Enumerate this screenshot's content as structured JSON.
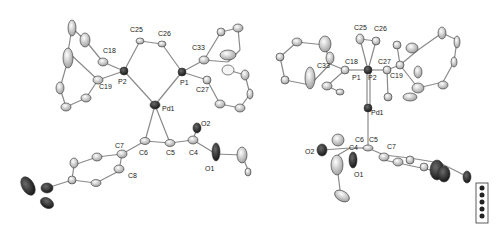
{
  "figure": {
    "type": "ORTEP crystal structure (two views)",
    "background": "#ffffff",
    "colors": {
      "bond": "#8a8a8a",
      "atom_light": "#d8d8d8",
      "atom_mid": "#a8a8a8",
      "atom_dark": "#2a2a2a",
      "label": "#222222"
    }
  },
  "view_left": {
    "labels": {
      "c25": "C25",
      "c26": "C26",
      "c18": "C18",
      "c19": "C19",
      "p2": "P2",
      "p1": "P1",
      "c33": "C33",
      "c27": "C27",
      "pd1": "Pd1",
      "o2": "O2",
      "c7": "C7",
      "c6": "C6",
      "c5": "C5",
      "c4": "C4",
      "o1": "O1",
      "c8": "C8"
    }
  },
  "view_right": {
    "labels": {
      "c25": "C25",
      "c26": "C26",
      "c33": "C33",
      "c18": "C18",
      "c27": "C27",
      "c19": "C19",
      "p1": "P1",
      "p2": "P2",
      "pd1": "Pd1",
      "c6": "C6",
      "c5": "C5",
      "c4": "C4",
      "c7": "C7",
      "o2": "O2",
      "o1": "O1"
    }
  },
  "legend_box": {
    "items": 5
  }
}
